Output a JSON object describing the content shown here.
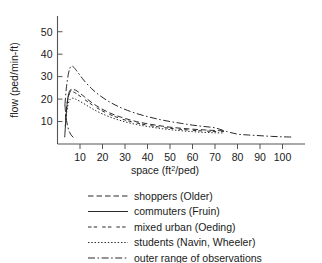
{
  "chart_data": {
    "type": "line",
    "title": "",
    "xlabel": "space (ft2/ped)",
    "xlabel_base": "space (ft",
    "xlabel_sup": "2",
    "xlabel_tail": "/ped)",
    "ylabel": "flow (ped/min-ft)",
    "xlim": [
      0,
      110
    ],
    "ylim": [
      0,
      57
    ],
    "xticks": [
      10,
      20,
      30,
      40,
      50,
      60,
      70,
      80,
      90,
      100
    ],
    "yticks": [
      10,
      20,
      30,
      40,
      50
    ],
    "grid": false,
    "legend_position": "below",
    "series": [
      {
        "name": "shoppers (Older)",
        "style": "dashed",
        "x": [
          3.5,
          4.5,
          5.5,
          6.5,
          8,
          10,
          12,
          15,
          18,
          22,
          26,
          30,
          35,
          40,
          45,
          50,
          55,
          60,
          65,
          70,
          74
        ],
        "y": [
          10.5,
          19.5,
          23.0,
          24.2,
          24.0,
          22.6,
          21.0,
          18.6,
          16.6,
          14.4,
          12.7,
          11.4,
          10.0,
          9.0,
          8.2,
          7.5,
          7.0,
          6.6,
          6.3,
          6.0,
          5.9
        ]
      },
      {
        "name": "commuters (Fruin)",
        "style": "solid",
        "x": [
          3.2,
          3.8,
          4.4,
          5.0,
          5.6,
          6.2
        ],
        "y": [
          3.0,
          12.0,
          19.0,
          22.5,
          24.0,
          24.3
        ]
      },
      {
        "name": "mixed urban (Oeding)",
        "style": "dash-gap",
        "x": [
          3.6,
          4.6,
          5.6,
          7,
          9,
          11,
          14,
          17,
          21,
          25,
          30,
          35,
          40,
          45,
          50,
          55,
          60,
          65,
          70,
          74
        ],
        "y": [
          12.0,
          20.0,
          22.8,
          23.2,
          22.0,
          20.6,
          18.4,
          16.4,
          14.2,
          12.4,
          10.7,
          9.4,
          8.4,
          7.6,
          7.0,
          6.5,
          6.1,
          5.8,
          5.6,
          5.5
        ]
      },
      {
        "name": "students (Navin, Wheeler)",
        "style": "dotted",
        "x": [
          3.4,
          4.2,
          5.2,
          6.5,
          8,
          10,
          13,
          16,
          20,
          25,
          30,
          35,
          40,
          45,
          50,
          55,
          60,
          65,
          70,
          74
        ],
        "y": [
          8.0,
          15.0,
          19.2,
          20.4,
          20.0,
          19.0,
          17.2,
          15.4,
          13.4,
          11.4,
          9.9,
          8.7,
          7.8,
          7.0,
          6.4,
          5.9,
          5.5,
          5.2,
          5.0,
          4.9
        ]
      },
      {
        "name": "outer range of observations",
        "style": "dash-dot",
        "x": [
          3.3,
          4.0,
          5.0,
          6.0,
          7.0,
          8.5,
          10,
          12,
          15,
          18,
          22,
          26,
          30,
          35,
          40,
          45,
          50,
          55,
          60,
          65,
          70,
          75,
          80,
          85,
          90,
          95,
          100,
          104
        ],
        "y": [
          17.5,
          25.5,
          32.0,
          34.6,
          34.4,
          32.6,
          30.6,
          28.0,
          24.8,
          22.2,
          19.4,
          17.2,
          15.4,
          13.6,
          12.2,
          11.0,
          10.0,
          9.2,
          8.4,
          7.8,
          7.2,
          5.6,
          4.4,
          4.0,
          3.7,
          3.4,
          3.2,
          3.1
        ]
      }
    ],
    "lower_bound": {
      "name": "outer range lower bound",
      "style": "dash-dot",
      "x": [
        3.3,
        3.6,
        4.0,
        4.6,
        5.4,
        6.4,
        7.6
      ],
      "y": [
        17.5,
        14.0,
        10.5,
        7.5,
        5.2,
        3.6,
        2.4
      ]
    }
  },
  "legend": {
    "items": [
      {
        "label": "shoppers (Older)",
        "style": "dashed"
      },
      {
        "label": "commuters (Fruin)",
        "style": "solid"
      },
      {
        "label": "mixed urban (Oeding)",
        "style": "dash-gap"
      },
      {
        "label": "students (Navin, Wheeler)",
        "style": "dotted"
      },
      {
        "label": "outer range of observations",
        "style": "dash-dot"
      }
    ]
  },
  "colors": {
    "background": "#ffffff",
    "ink": "#1a1a1a",
    "axis": "#555555",
    "curve": "#2a2a2a"
  }
}
